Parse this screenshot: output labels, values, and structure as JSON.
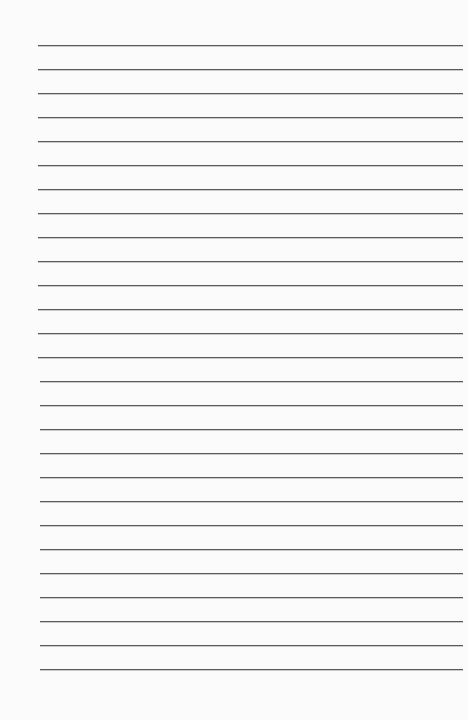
{
  "paper": {
    "type": "lined-paper",
    "background_color": "#fbfbfb",
    "line_color": "#5a5a5a",
    "line_count": 27,
    "first_line_y": 45,
    "line_spacing": 24,
    "line_left": 38,
    "line_right": 463
  }
}
